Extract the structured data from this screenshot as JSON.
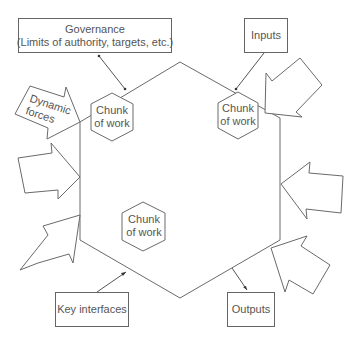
{
  "diagram": {
    "governance": {
      "line1": "Governance",
      "line2": "(Limits of authority, targets, etc.)"
    },
    "inputs": "Inputs",
    "outputs": "Outputs",
    "key_interfaces": "Key interfaces",
    "dynamic_forces": {
      "line1": "Dynamic",
      "line2": "forces"
    },
    "chunks": [
      {
        "line1": "Chunk",
        "line2": "of work"
      },
      {
        "line1": "Chunk",
        "line2": "of work"
      },
      {
        "line1": "Chunk",
        "line2": "of work"
      }
    ],
    "colors": {
      "stroke": "#666666",
      "text": "#555555",
      "background": "#ffffff"
    }
  }
}
